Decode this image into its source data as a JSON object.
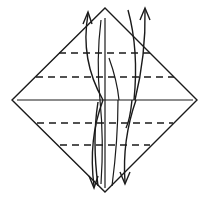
{
  "diagram": {
    "type": "origami-fold-diagram",
    "colors": {
      "line": "#1a1a1a",
      "background": "#ffffff"
    },
    "diamond": {
      "top": [
        105,
        8
      ],
      "right": [
        197,
        100
      ],
      "bottom": [
        105,
        192
      ],
      "left": [
        12,
        100
      ]
    },
    "center_line_y": 100,
    "dashed_lines_y": [
      53,
      77,
      123,
      145
    ],
    "arrows": [
      {
        "name": "up-arrow-left",
        "direction": "up"
      },
      {
        "name": "up-arrow-right",
        "direction": "up"
      },
      {
        "name": "down-arrow-left",
        "direction": "down"
      },
      {
        "name": "down-arrow-right",
        "direction": "down"
      }
    ]
  }
}
